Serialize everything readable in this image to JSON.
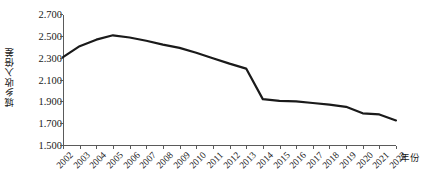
{
  "chart_data": {
    "type": "line",
    "title": "",
    "xlabel": "年份",
    "ylabel": "城乡收入倍差",
    "categories": [
      "2002",
      "2003",
      "2004",
      "2005",
      "2006",
      "2007",
      "2008",
      "2009",
      "2010",
      "2011",
      "2012",
      "2013",
      "2014",
      "2015",
      "2016",
      "2017",
      "2018",
      "2019",
      "2020",
      "2021",
      "2022"
    ],
    "values": [
      2.305,
      2.405,
      2.465,
      2.505,
      2.485,
      2.455,
      2.42,
      2.39,
      2.345,
      2.295,
      2.245,
      2.2,
      1.92,
      1.905,
      1.9,
      1.885,
      1.87,
      1.85,
      1.79,
      1.78,
      1.725
    ],
    "ylim": [
      1.5,
      2.7
    ],
    "yticks": [
      "2.700",
      "2.500",
      "2.300",
      "2.100",
      "1.900",
      "1.700",
      "1.500"
    ],
    "ytick_values": [
      2.7,
      2.5,
      2.3,
      2.1,
      1.9,
      1.7,
      1.5
    ],
    "grid": false,
    "legend": "none",
    "series_color": "#1a1a1a",
    "axis_color": "#5a5a5a",
    "line_width": 2.2
  }
}
